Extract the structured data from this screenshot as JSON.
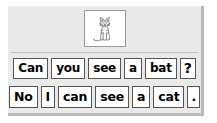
{
  "worksheet": {
    "picture": {
      "alt_label": "cat-line-drawing",
      "frame_name": "picture-frame"
    },
    "rows": [
      {
        "id": "row-1",
        "sentence": "Can you see a bat ?",
        "cards": [
          {
            "text": "Can",
            "kind": "word"
          },
          {
            "text": "you",
            "kind": "word"
          },
          {
            "text": "see",
            "kind": "word"
          },
          {
            "text": "a",
            "kind": "word"
          },
          {
            "text": "bat",
            "kind": "word"
          },
          {
            "text": "?",
            "kind": "punct"
          }
        ]
      },
      {
        "id": "row-2",
        "sentence": "No I can see a cat .",
        "cards": [
          {
            "text": "No",
            "kind": "word"
          },
          {
            "text": "I",
            "kind": "word"
          },
          {
            "text": "can",
            "kind": "word"
          },
          {
            "text": "see",
            "kind": "word"
          },
          {
            "text": "a",
            "kind": "word"
          },
          {
            "text": "cat",
            "kind": "word"
          },
          {
            "text": ".",
            "kind": "punct"
          }
        ]
      }
    ],
    "colors": {
      "panel_background": "#e9e9e9",
      "panel_shadow": "#b9b9b9",
      "card_background": "#ffffff",
      "card_border": "#555555",
      "separator": "#c2c2c2",
      "text": "#000000",
      "picture_border": "#9a9a9a"
    }
  }
}
